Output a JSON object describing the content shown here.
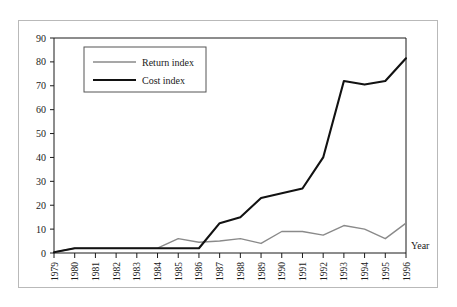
{
  "figure": {
    "frame_color": "#b9b9b9",
    "background": "#ffffff"
  },
  "chart_data": {
    "type": "line",
    "title": "",
    "xlabel": "Year",
    "ylabel": "",
    "ylim": [
      0,
      90
    ],
    "ytick_step": 10,
    "grid": false,
    "legend_position": "upper-left",
    "categories": [
      "1979",
      "1980",
      "1981",
      "1982",
      "1983",
      "1984",
      "1985",
      "1986",
      "1987",
      "1988",
      "1989",
      "1990",
      "1991",
      "1992",
      "1993",
      "1994",
      "1995",
      "1996"
    ],
    "yticks": [
      "0",
      "10",
      "20",
      "30",
      "40",
      "50",
      "60",
      "70",
      "80",
      "90"
    ],
    "series": [
      {
        "name": "Return index",
        "color": "#8a8a8a",
        "values": [
          0.3,
          2,
          2,
          2,
          2,
          2,
          6,
          4.5,
          5,
          6,
          4,
          9,
          9,
          7.5,
          11.5,
          10,
          6,
          12.5
        ]
      },
      {
        "name": "Cost index",
        "color": "#121212",
        "values": [
          0.3,
          2,
          2,
          2,
          2,
          2,
          2,
          2,
          12.5,
          15,
          23,
          25,
          27,
          40,
          72,
          70.5,
          72,
          81.5
        ]
      }
    ]
  },
  "axis": {
    "year_label": "Year"
  },
  "legend": {
    "entries": [
      {
        "label": "Return index"
      },
      {
        "label": "Cost index"
      }
    ]
  }
}
